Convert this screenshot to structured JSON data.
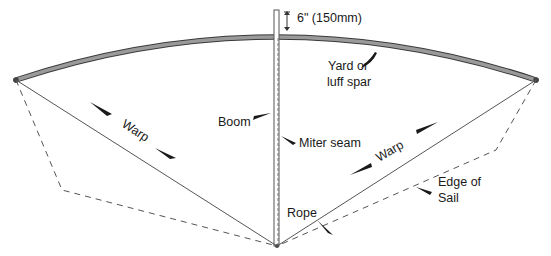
{
  "diagram": {
    "labels": {
      "dimension": "6\" (150mm)",
      "yard_line1": "Yard or",
      "yard_line2": "luff spar",
      "boom": "Boom",
      "miter_seam": "Miter seam",
      "warp_left": "Warp",
      "warp_right": "Warp",
      "rope": "Rope",
      "edge_line1": "Edge of",
      "edge_line2": "Sail"
    },
    "colors": {
      "spar_fill": "#8a8a8a",
      "spar_stroke": "#3a3a3a",
      "line": "#555555",
      "text": "#1a1a1a",
      "arrow": "#1a1a1a"
    }
  }
}
